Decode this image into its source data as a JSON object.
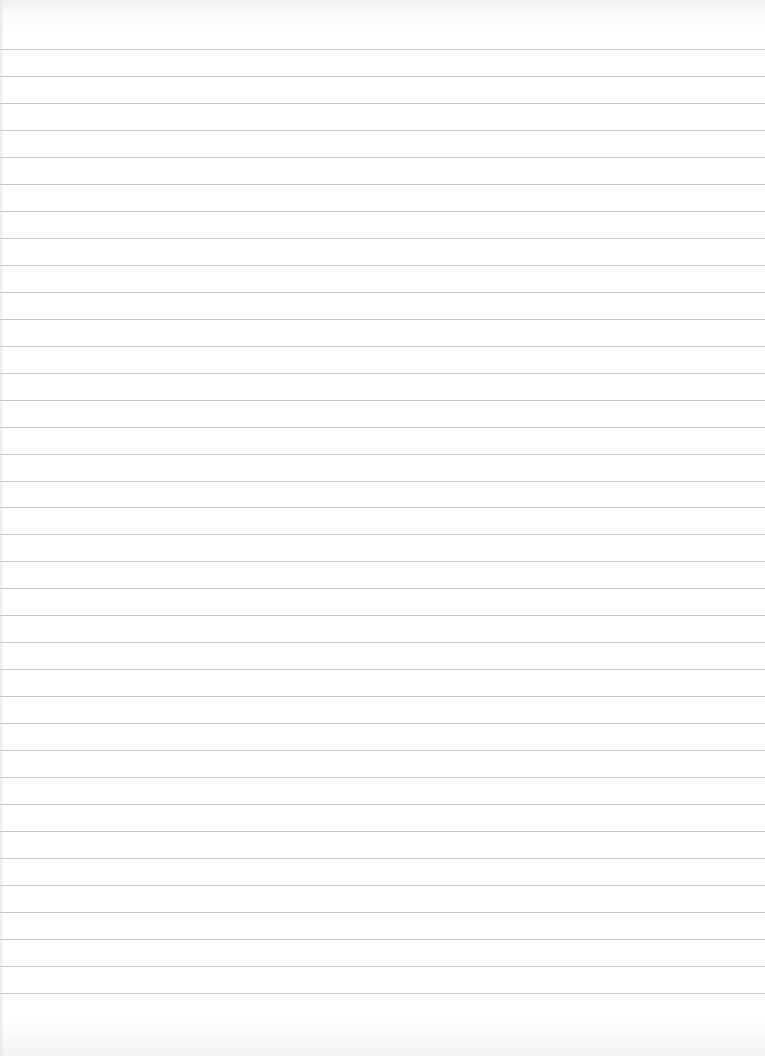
{
  "page": {
    "type": "lined-paper",
    "background_color": "#ffffff",
    "line_color": "#c9c9c9",
    "line_count": 36,
    "first_line_y": 49,
    "line_spacing": 26.97,
    "text": ""
  }
}
